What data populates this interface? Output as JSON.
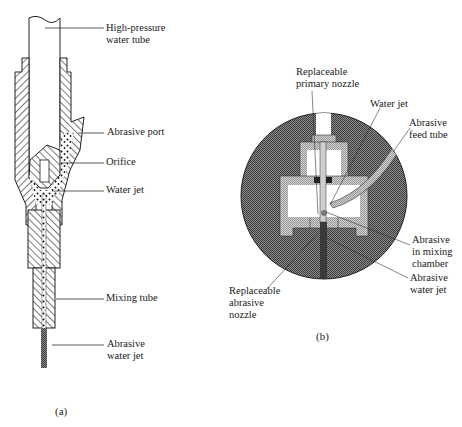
{
  "figure_a": {
    "caption": "(a)",
    "labels": {
      "high_pressure_tube_1": "High-pressure",
      "high_pressure_tube_2": "water tube",
      "abrasive_port": "Abrasive port",
      "orifice": "Orifice",
      "water_jet": "Water jet",
      "mixing_tube": "Mixing tube",
      "abrasive_water_jet_1": "Abrasive",
      "abrasive_water_jet_2": "water jet"
    }
  },
  "figure_b": {
    "caption": "(b)",
    "labels": {
      "primary_nozzle_1": "Replaceable",
      "primary_nozzle_2": "primary nozzle",
      "water_jet": "Water jet",
      "feed_tube_1": "Abrasive",
      "feed_tube_2": "feed tube",
      "mixing_chamber_1": "Abrasive",
      "mixing_chamber_2": "in mixing",
      "mixing_chamber_3": "chamber",
      "abrasive_water_jet_1": "Abrasive",
      "abrasive_water_jet_2": "water jet",
      "abrasive_nozzle_1": "Replaceable",
      "abrasive_nozzle_2": "abrasive",
      "abrasive_nozzle_3": "nozzle"
    }
  },
  "colors": {
    "ink": "#1a1a1a",
    "circle_fill": "#6e6e6e",
    "light_part": "#bdbdbd",
    "jet_dark": "#3a3a3a"
  }
}
